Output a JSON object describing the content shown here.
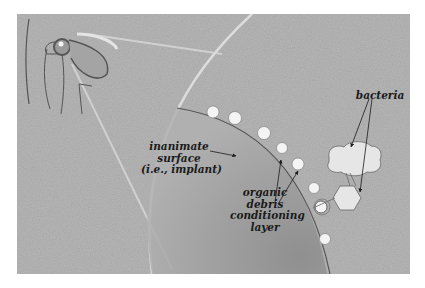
{
  "figure": {
    "colors": {
      "background": "#b4b4b4",
      "implant_fill": "#9a9a9a",
      "conditioning_particle": "#f4f4f4",
      "bacteria_fill": "#e6e6e6",
      "outline": "#555555",
      "text": "#1a1a1a"
    }
  },
  "labels": {
    "inanimate_surface": {
      "line1": "inanimate",
      "line2": "surface",
      "line3": "(i.e., implant)"
    },
    "conditioning_layer": {
      "line1": "organic",
      "line2": "debris",
      "line3": "conditioning",
      "line4": "layer"
    },
    "bacteria": "bacteria"
  },
  "icons": {
    "hip_joint": "hip-joint-illustration",
    "bacterium_cloud": "cloud-shaped-bacterium",
    "bacterium_hexagon": "hexagon-shaped-bacterium"
  }
}
